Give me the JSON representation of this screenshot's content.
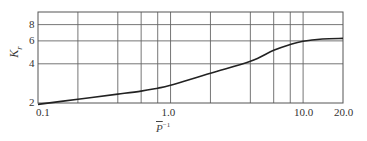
{
  "chart_data": {
    "type": "line",
    "title": "",
    "xlabel": "P̄⁻¹",
    "xlabel_base": "P",
    "xlabel_sup": "−1",
    "ylabel": "Kᵣ",
    "ylabel_base": "K",
    "ylabel_sub": "r",
    "xscale": "log",
    "yscale": "log",
    "xlim": [
      0.1,
      20.0
    ],
    "ylim": [
      2,
      10
    ],
    "grid": true,
    "legend": null,
    "x_tick_labels": [
      "0.1",
      "1.0",
      "10.0",
      "20.0"
    ],
    "x_tick_values": [
      0.1,
      1.0,
      10.0,
      20.0
    ],
    "x_gridlines": [
      0.2,
      0.4,
      0.6,
      0.8,
      1.0,
      2.0,
      4.0,
      6.0,
      8.0,
      10.0
    ],
    "y_tick_labels": [
      "2",
      "4",
      "6",
      "8"
    ],
    "y_tick_values": [
      2,
      4,
      6,
      8
    ],
    "y_gridlines": [
      4,
      6,
      8
    ],
    "series": [
      {
        "name": "Kr",
        "x": [
          0.1,
          0.2,
          0.4,
          0.6,
          0.8,
          1.0,
          2.0,
          4.0,
          6.0,
          8.0,
          10.0,
          14.0,
          20.0
        ],
        "values": [
          1.95,
          2.14,
          2.34,
          2.47,
          2.6,
          2.74,
          3.39,
          4.18,
          5.08,
          5.64,
          5.97,
          6.2,
          6.27
        ]
      }
    ]
  }
}
